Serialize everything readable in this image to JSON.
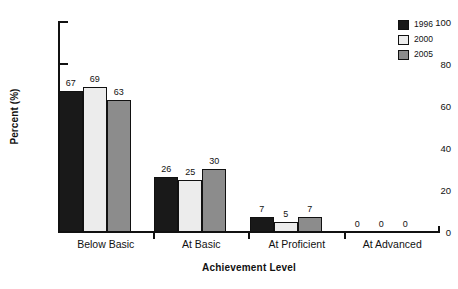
{
  "chart_data": {
    "type": "bar",
    "title": "",
    "xlabel": "Achievement Level",
    "ylabel": "Percent (%)",
    "ylim": [
      0,
      100
    ],
    "yticks": [
      0,
      20,
      40,
      60,
      80,
      100
    ],
    "ytick_labels": [
      "0",
      "20",
      "40",
      "60",
      "80",
      "100"
    ],
    "grid": false,
    "legend_position": "top-right",
    "categories": [
      "Below Basic",
      "At Basic",
      "At Proficient",
      "At Advanced"
    ],
    "series": [
      {
        "name": "1996",
        "color": "#191919",
        "values": [
          67,
          26,
          7,
          0
        ],
        "value_labels": [
          "67",
          "26",
          "7",
          "0"
        ]
      },
      {
        "name": "2000",
        "color": "#ececec",
        "values": [
          69,
          25,
          5,
          0
        ],
        "value_labels": [
          "69",
          "25",
          "5",
          "0"
        ]
      },
      {
        "name": "2005",
        "color": "#8c8c8c",
        "values": [
          63,
          30,
          7,
          0
        ],
        "value_labels": [
          "63",
          "30",
          "7",
          "0"
        ]
      }
    ]
  },
  "axes": {
    "y_title": "Percent (%)",
    "x_title": "Achievement Level",
    "y_ticks": [
      {
        "label": "100",
        "value": 100
      },
      {
        "label": "80",
        "value": 80
      },
      {
        "label": "60",
        "value": 60
      },
      {
        "label": "40",
        "value": 40
      },
      {
        "label": "20",
        "value": 20
      },
      {
        "label": "0",
        "value": 0
      }
    ],
    "x_categories": [
      {
        "label": "Below Basic"
      },
      {
        "label": "At Basic"
      },
      {
        "label": "At Proficient"
      },
      {
        "label": "At Advanced"
      }
    ]
  },
  "legend": {
    "entries": [
      {
        "label": "1996",
        "color": "#191919"
      },
      {
        "label": "2000",
        "color": "#ececec"
      },
      {
        "label": "2005",
        "color": "#8c8c8c"
      }
    ]
  },
  "groups": [
    {
      "label": "Below Basic",
      "bars": [
        {
          "series": "1996",
          "value": 67,
          "label": "67",
          "color": "#191919"
        },
        {
          "series": "2000",
          "value": 69,
          "label": "69",
          "color": "#ececec"
        },
        {
          "series": "2005",
          "value": 63,
          "label": "63",
          "color": "#8c8c8c"
        }
      ]
    },
    {
      "label": "At Basic",
      "bars": [
        {
          "series": "1996",
          "value": 26,
          "label": "26",
          "color": "#191919"
        },
        {
          "series": "2000",
          "value": 25,
          "label": "25",
          "color": "#ececec"
        },
        {
          "series": "2005",
          "value": 30,
          "label": "30",
          "color": "#8c8c8c"
        }
      ]
    },
    {
      "label": "At Proficient",
      "bars": [
        {
          "series": "1996",
          "value": 7,
          "label": "7",
          "color": "#191919"
        },
        {
          "series": "2000",
          "value": 5,
          "label": "5",
          "color": "#ececec"
        },
        {
          "series": "2005",
          "value": 7,
          "label": "7",
          "color": "#8c8c8c"
        }
      ]
    },
    {
      "label": "At Advanced",
      "bars": [
        {
          "series": "1996",
          "value": 0,
          "label": "0",
          "color": "#191919"
        },
        {
          "series": "2000",
          "value": 0,
          "label": "0",
          "color": "#ececec"
        },
        {
          "series": "2005",
          "value": 0,
          "label": "0",
          "color": "#8c8c8c"
        }
      ]
    }
  ]
}
